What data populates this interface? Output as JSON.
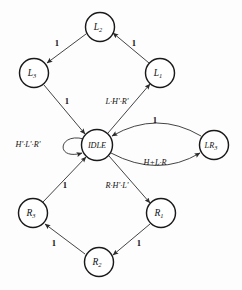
{
  "diagram": {
    "type": "state-transition-diagram",
    "nodes": [
      {
        "id": "L2",
        "label": "L",
        "sub": "2",
        "cx": 100,
        "cy": 27,
        "r": 14.5
      },
      {
        "id": "L3",
        "label": "L",
        "sub": "3",
        "cx": 34,
        "cy": 73,
        "r": 14.5
      },
      {
        "id": "L1",
        "label": "L",
        "sub": "1",
        "cx": 160,
        "cy": 73,
        "r": 14.5
      },
      {
        "id": "IDLE",
        "label": "IDLE",
        "sub": "",
        "cx": 97,
        "cy": 145,
        "r": 15.5
      },
      {
        "id": "LR3",
        "label": "LR",
        "sub": "3",
        "cx": 214,
        "cy": 145,
        "r": 14.5
      },
      {
        "id": "R3",
        "label": "R",
        "sub": "3",
        "cx": 33,
        "cy": 213,
        "r": 14.5
      },
      {
        "id": "R1",
        "label": "R",
        "sub": "1",
        "cx": 161,
        "cy": 213,
        "r": 14.5
      },
      {
        "id": "R2",
        "label": "R",
        "sub": "2",
        "cx": 99,
        "cy": 262,
        "r": 14.5
      }
    ],
    "edges": [
      {
        "id": "idle-to-l1",
        "from": "IDLE",
        "to": "L1",
        "label": "L·H'·R'",
        "label_x": 117,
        "label_y": 102,
        "bold": false
      },
      {
        "id": "l1-to-l2",
        "from": "L1",
        "to": "L2",
        "label": "1",
        "label_x": 134,
        "label_y": 44,
        "bold": true
      },
      {
        "id": "l2-to-l3",
        "from": "L2",
        "to": "L3",
        "label": "1",
        "label_x": 57,
        "label_y": 44,
        "bold": true
      },
      {
        "id": "l3-to-idle",
        "from": "L3",
        "to": "IDLE",
        "label": "1",
        "label_x": 67,
        "label_y": 102,
        "bold": true
      },
      {
        "id": "idle-to-r1",
        "from": "IDLE",
        "to": "R1",
        "label": "R·H'·L'",
        "label_x": 117,
        "label_y": 186,
        "bold": false
      },
      {
        "id": "r1-to-r2",
        "from": "R1",
        "to": "R2",
        "label": "1",
        "label_x": 139,
        "label_y": 244,
        "bold": true
      },
      {
        "id": "r2-to-r3",
        "from": "R2",
        "to": "R3",
        "label": "1",
        "label_x": 54,
        "label_y": 244,
        "bold": true
      },
      {
        "id": "r3-to-idle",
        "from": "R3",
        "to": "IDLE",
        "label": "1",
        "label_x": 65,
        "label_y": 186,
        "bold": true
      },
      {
        "id": "idle-to-lr3",
        "from": "IDLE",
        "to": "LR3",
        "label": "H+L·R",
        "label_x": 155,
        "label_y": 163,
        "bold": false
      },
      {
        "id": "lr3-to-idle",
        "from": "LR3",
        "to": "IDLE",
        "label": "1",
        "label_x": 155,
        "label_y": 121,
        "bold": true
      },
      {
        "id": "idle-self",
        "from": "IDLE",
        "to": "IDLE",
        "label": "H'·L'·R'",
        "label_x": 28,
        "label_y": 145,
        "bold": false
      }
    ]
  }
}
